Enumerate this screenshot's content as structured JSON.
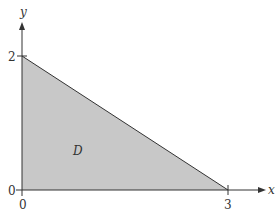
{
  "diagram": {
    "axes": {
      "x_label": "x",
      "y_label": "y",
      "origin_x_tick": "0",
      "origin_y_tick": "0",
      "x_tick": "3",
      "y_tick": "2"
    },
    "region": {
      "label": "D",
      "vertices": [
        [
          0,
          0
        ],
        [
          3,
          0
        ],
        [
          0,
          2
        ]
      ],
      "fill_color": "#c8c8c8",
      "edge_color": "#333333"
    }
  }
}
